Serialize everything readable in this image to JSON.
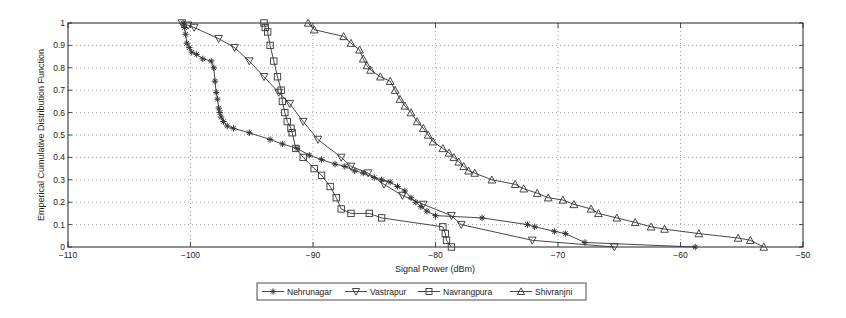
{
  "chart_data": {
    "type": "line",
    "title": "",
    "xlabel": "Signal Power (dBm)",
    "ylabel": "Emperical Cumulative Distribution Function",
    "xlim": [
      -110,
      -50
    ],
    "ylim": [
      0,
      1
    ],
    "xticks": [
      -110,
      -100,
      -90,
      -80,
      -70,
      -60,
      -50
    ],
    "yticks": [
      0,
      0.1,
      0.2,
      0.3,
      0.4,
      0.5,
      0.6,
      0.7,
      0.8,
      0.9,
      1
    ],
    "ytick_labels": [
      "0",
      "0.1",
      "0.2",
      "0.3",
      "0.4",
      "0.5",
      "0.6",
      "0.7",
      "0.8",
      "0.9",
      "1"
    ],
    "grid": true,
    "legend_position": "bottom-outside",
    "series": [
      {
        "name": "Nehrunagar",
        "marker": "asterisk",
        "x": [
          -100.6,
          -100.5,
          -100.4,
          -100.3,
          -100.1,
          -99.9,
          -99.5,
          -99.0,
          -98.3,
          -98.1,
          -98.0,
          -97.9,
          -97.8,
          -97.7,
          -97.6,
          -97.5,
          -97.3,
          -97.0,
          -96.5,
          -95.2,
          -93.5,
          -92.5,
          -91.3,
          -90.3,
          -89.3,
          -88.2,
          -87.4,
          -86.6,
          -85.9,
          -85.0,
          -84.4,
          -83.7,
          -83.1,
          -82.5,
          -82.0,
          -81.6,
          -81.2,
          -80.7,
          -80.0,
          -76.2,
          -72.5,
          -71.9,
          -70.3,
          -69.4,
          -67.8,
          -58.8
        ],
        "y": [
          1.0,
          0.98,
          0.95,
          0.91,
          0.89,
          0.87,
          0.86,
          0.84,
          0.83,
          0.8,
          0.74,
          0.69,
          0.66,
          0.62,
          0.6,
          0.58,
          0.56,
          0.54,
          0.53,
          0.51,
          0.48,
          0.46,
          0.44,
          0.41,
          0.39,
          0.37,
          0.36,
          0.34,
          0.33,
          0.31,
          0.3,
          0.29,
          0.27,
          0.25,
          0.22,
          0.2,
          0.18,
          0.16,
          0.14,
          0.13,
          0.1,
          0.09,
          0.07,
          0.06,
          0.02,
          0.0
        ]
      },
      {
        "name": "Vastrapur",
        "marker": "triangle-down",
        "x": [
          -100.7,
          -100.2,
          -99.7,
          -97.7,
          -96.4,
          -95.2,
          -94.0,
          -92.8,
          -91.9,
          -90.8,
          -89.6,
          -87.7,
          -86.9,
          -85.5,
          -84.2,
          -82.7,
          -81.0,
          -78.7,
          -77.9,
          -72.1,
          -65.4
        ],
        "y": [
          1.0,
          0.99,
          0.98,
          0.93,
          0.89,
          0.83,
          0.76,
          0.69,
          0.64,
          0.56,
          0.48,
          0.4,
          0.36,
          0.33,
          0.28,
          0.23,
          0.19,
          0.14,
          0.1,
          0.03,
          0.0
        ]
      },
      {
        "name": "Navrangpura",
        "marker": "square",
        "x": [
          -94.0,
          -93.9,
          -93.7,
          -93.5,
          -93.2,
          -92.9,
          -92.6,
          -92.5,
          -92.3,
          -92.1,
          -91.8,
          -91.7,
          -91.4,
          -90.8,
          -89.9,
          -89.3,
          -88.6,
          -88.1,
          -87.7,
          -86.9,
          -85.4,
          -84.4,
          -79.4,
          -79.2,
          -79.1,
          -78.7
        ],
        "y": [
          1.0,
          0.98,
          0.96,
          0.9,
          0.83,
          0.76,
          0.7,
          0.65,
          0.6,
          0.56,
          0.53,
          0.51,
          0.44,
          0.4,
          0.35,
          0.32,
          0.27,
          0.22,
          0.17,
          0.15,
          0.15,
          0.13,
          0.09,
          0.06,
          0.03,
          0.0
        ]
      },
      {
        "name": "Shivranjni",
        "marker": "triangle-up",
        "x": [
          -90.4,
          -89.9,
          -87.5,
          -86.9,
          -86.2,
          -85.9,
          -85.6,
          -85.3,
          -84.5,
          -83.7,
          -83.3,
          -82.9,
          -82.5,
          -82.0,
          -81.5,
          -81.0,
          -80.6,
          -80.2,
          -79.4,
          -78.9,
          -78.5,
          -78.1,
          -77.7,
          -77.3,
          -76.8,
          -75.4,
          -73.5,
          -72.8,
          -71.7,
          -70.8,
          -69.6,
          -68.7,
          -67.3,
          -66.7,
          -65.2,
          -63.7,
          -62.4,
          -61.3,
          -58.5,
          -55.3,
          -54.3,
          -53.2
        ],
        "y": [
          1.0,
          0.97,
          0.94,
          0.91,
          0.88,
          0.84,
          0.81,
          0.79,
          0.76,
          0.74,
          0.7,
          0.66,
          0.63,
          0.6,
          0.56,
          0.53,
          0.5,
          0.47,
          0.44,
          0.42,
          0.4,
          0.38,
          0.36,
          0.34,
          0.33,
          0.3,
          0.28,
          0.26,
          0.24,
          0.22,
          0.21,
          0.19,
          0.17,
          0.15,
          0.13,
          0.11,
          0.09,
          0.08,
          0.06,
          0.04,
          0.03,
          0.0
        ]
      }
    ]
  },
  "axes": {
    "xlabel": "Signal Power (dBm)",
    "ylabel": "Emperical Cumulative Distribution Function"
  },
  "legend": {
    "items": [
      {
        "label": "Nehrunagar",
        "marker": "asterisk"
      },
      {
        "label": "Vastrapur",
        "marker": "triangle-down"
      },
      {
        "label": "Navrangpura",
        "marker": "square"
      },
      {
        "label": "Shivranjni",
        "marker": "triangle-up"
      }
    ]
  },
  "colors": {
    "line": "#333333",
    "axis": "#222222",
    "grid": "#888888",
    "background": "#ffffff"
  }
}
